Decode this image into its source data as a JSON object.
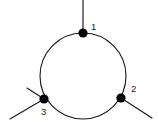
{
  "figure": {
    "background_color": "#ffffff",
    "stroke_color": "#1a1a1a",
    "node_color": "#000000",
    "width": 158,
    "height": 134
  },
  "circle": {
    "cx": 83,
    "cy": 76,
    "r": 43
  },
  "nodes": [
    {
      "id": "1",
      "label": "1",
      "cx": 83,
      "cy": 33,
      "r": 4.6,
      "label_x": 91,
      "label_y": 27
    },
    {
      "id": "2",
      "label": "2",
      "cx": 121,
      "cy": 98,
      "r": 4.6,
      "label_x": 131,
      "label_y": 89
    },
    {
      "id": "3",
      "label": "3",
      "cx": 44,
      "cy": 99,
      "r": 4.6,
      "label_x": 41,
      "label_y": 112
    }
  ],
  "edges": [
    {
      "name": "pendant-edge-node1-up",
      "d": "M 83 33 L 83 0"
    },
    {
      "name": "pendant-edge-node2-downright",
      "d": "M 121 98 L 152 118"
    },
    {
      "name": "pendant-edge-node3-upleft",
      "d": "M 44 99 L 27 88"
    },
    {
      "name": "pendant-edge-node3-downleft",
      "d": "M 44 99 L 10 119"
    }
  ]
}
